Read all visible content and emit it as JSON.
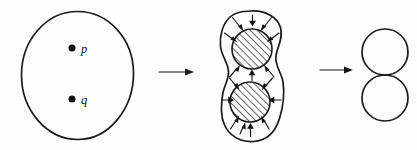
{
  "figure": {
    "background_color": "#fdfdfd",
    "ink_color": "#1a1a1a",
    "panels": [
      {
        "id": "panel-1",
        "name": "disk-with-two-points",
        "shape": "circle",
        "description": "Large open disk containing two marked interior points",
        "center": [
          77.5,
          75
        ],
        "radius": 56,
        "points": [
          {
            "name": "point-p",
            "label": "p",
            "cx": 72,
            "cy": 48,
            "r": 3.4
          },
          {
            "name": "point-q",
            "label": "q",
            "cx": 72,
            "cy": 99,
            "r": 3.4
          }
        ]
      },
      {
        "id": "panel-2",
        "name": "pinching-region",
        "shape": "peanut",
        "description": "Peanut shaped region pinching onto two shaded disks, arrows contract inward",
        "disks": [
          {
            "name": "hatched-disk-upper",
            "cx": 252,
            "cy": 49,
            "r": 20,
            "fill": "diagonal-hatch"
          },
          {
            "name": "hatched-disk-lower",
            "cx": 250,
            "cy": 102,
            "r": 20,
            "fill": "diagonal-hatch"
          }
        ],
        "arrow_count": 16,
        "arrow_direction": "inward"
      },
      {
        "id": "panel-3",
        "name": "wedge-of-two-circles",
        "shape": "two-tangent-circles",
        "description": "Two circles meeting at a single point, forming a figure eight",
        "circles": [
          {
            "name": "result-circle-upper",
            "cx": 385,
            "cy": 52,
            "r": 23
          },
          {
            "name": "result-circle-lower",
            "cx": 385,
            "cy": 98,
            "r": 23
          }
        ]
      }
    ],
    "connectors": [
      {
        "name": "transition-arrow-1",
        "from": "panel-1",
        "to": "panel-2",
        "glyph": "→",
        "x1": 158,
        "x2": 192,
        "y": 72
      },
      {
        "name": "transition-arrow-2",
        "from": "panel-2",
        "to": "panel-3",
        "glyph": "→",
        "x1": 318,
        "x2": 350,
        "y": 70
      }
    ],
    "labels": {
      "p": "p",
      "q": "q"
    }
  }
}
